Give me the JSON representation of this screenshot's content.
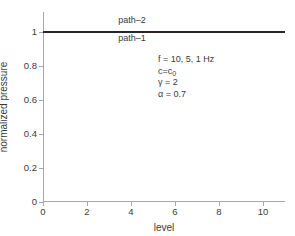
{
  "chart_data": {
    "type": "line",
    "title": "",
    "xlabel": "level",
    "ylabel": "normalized pressure",
    "xlim": [
      0,
      11
    ],
    "ylim": [
      0,
      1.12
    ],
    "grid": false,
    "legend_position": "inline-on-curve",
    "xticks": [
      0,
      2,
      4,
      6,
      8,
      10
    ],
    "xticklabels": [
      "0",
      "2",
      "4",
      "6",
      "8",
      "10"
    ],
    "yticks": [
      0,
      0.2,
      0.4,
      0.6,
      0.8,
      1
    ],
    "yticklabels": [
      "0",
      "0.2",
      "0.4",
      "0.6",
      "0.8",
      "1"
    ],
    "series": [
      {
        "name": "path-1",
        "color": "#262626",
        "x": [
          0,
          1,
          2,
          3,
          4,
          5,
          6,
          7,
          8,
          9,
          10,
          11
        ],
        "values": [
          1,
          1,
          1,
          1,
          1,
          1,
          1,
          1,
          1,
          1,
          1,
          1
        ]
      },
      {
        "name": "path-2",
        "color": "#262626",
        "x": [
          0,
          1,
          2,
          3,
          4,
          5,
          6,
          7,
          8,
          9,
          10,
          11
        ],
        "values": [
          1,
          1,
          1,
          1,
          1,
          1,
          1,
          1,
          1,
          1,
          1,
          1
        ]
      }
    ],
    "curve_labels": [
      {
        "text": "path–2",
        "x": 4.05,
        "y": 1.075
      },
      {
        "text": "path–1",
        "x": 4.05,
        "y": 0.965
      }
    ],
    "annotations": [
      {
        "text": "f = 10, 5, 1 Hz"
      },
      {
        "text": "c=c",
        "sub": "0"
      },
      {
        "text": "γ = 2"
      },
      {
        "text": "α = 0.7"
      }
    ]
  },
  "colors": {
    "line": "#262626",
    "axis": "#a8a8a8",
    "text": "#3a3a3a",
    "background": "#ffffff"
  }
}
